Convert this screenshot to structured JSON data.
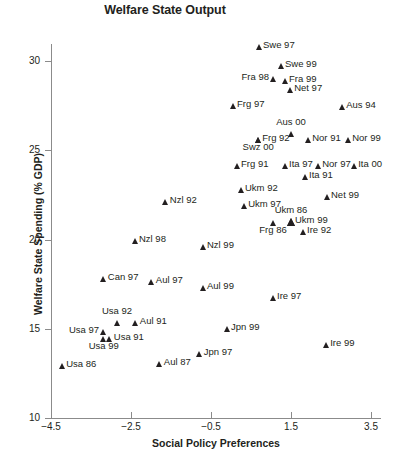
{
  "chart_data": {
    "type": "scatter",
    "title": "Welfare State Output",
    "xlabel": "Social Policy Preferences",
    "ylabel": "Welfare State Spending (% GDP)",
    "xlim": [
      -4.5,
      3.5
    ],
    "ylim": [
      10,
      32
    ],
    "xticks": [
      "-4.5",
      "-2.5",
      "-0.5",
      "1.5",
      "3.5"
    ],
    "xtick_values": [
      -4.5,
      -2.5,
      -0.5,
      1.5,
      3.5
    ],
    "yticks": [
      "10",
      "15",
      "20",
      "25",
      "30"
    ],
    "ytick_values": [
      10,
      15,
      20,
      25,
      30
    ],
    "grid": false,
    "legend": "none",
    "marker": "triangle",
    "marker_color": "#231f20",
    "points": [
      {
        "label": "Swe 97",
        "x": 0.7,
        "y": 30.8,
        "pos": "right"
      },
      {
        "label": "Swe 99",
        "x": 1.25,
        "y": 29.7,
        "pos": "right"
      },
      {
        "label": "Fra 98",
        "x": 1.05,
        "y": 29.0,
        "pos": "left"
      },
      {
        "label": "Fra 99",
        "x": 1.35,
        "y": 28.9,
        "pos": "right"
      },
      {
        "label": "Net 97",
        "x": 1.48,
        "y": 28.4,
        "pos": "right"
      },
      {
        "label": "Frg 97",
        "x": 0.05,
        "y": 27.5,
        "pos": "right"
      },
      {
        "label": "Aus 94",
        "x": 2.78,
        "y": 27.4,
        "pos": "right"
      },
      {
        "label": "Aus 00",
        "x": 1.5,
        "y": 25.9,
        "pos": "above"
      },
      {
        "label": "Frg 92",
        "x": 0.68,
        "y": 25.6,
        "pos": "right"
      },
      {
        "label": "Swz 00",
        "x": 0.68,
        "y": 25.6,
        "pos": "below"
      },
      {
        "label": "Nor 91",
        "x": 1.93,
        "y": 25.6,
        "pos": "right"
      },
      {
        "label": "Nor 99",
        "x": 2.93,
        "y": 25.6,
        "pos": "right"
      },
      {
        "label": "Frg 91",
        "x": 0.15,
        "y": 24.1,
        "pos": "right"
      },
      {
        "label": "Ita 97",
        "x": 1.35,
        "y": 24.1,
        "pos": "right"
      },
      {
        "label": "Nor 97",
        "x": 2.18,
        "y": 24.1,
        "pos": "right"
      },
      {
        "label": "Ita 00",
        "x": 3.08,
        "y": 24.1,
        "pos": "right"
      },
      {
        "label": "Ita 91",
        "x": 1.85,
        "y": 23.5,
        "pos": "right"
      },
      {
        "label": "Ukm 92",
        "x": 0.25,
        "y": 22.8,
        "pos": "right"
      },
      {
        "label": "Net 99",
        "x": 2.4,
        "y": 22.4,
        "pos": "right"
      },
      {
        "label": "Ukm 97",
        "x": 0.33,
        "y": 21.9,
        "pos": "right"
      },
      {
        "label": "Ukm 86",
        "x": 1.5,
        "y": 21.0,
        "pos": "above",
        "big": true
      },
      {
        "label": "Ukm 99",
        "x": 1.5,
        "y": 21.0,
        "pos": "right",
        "big": true
      },
      {
        "label": "Frg 86",
        "x": 1.05,
        "y": 20.9,
        "pos": "below"
      },
      {
        "label": "Ire 92",
        "x": 1.8,
        "y": 20.4,
        "pos": "right"
      },
      {
        "label": "Nzl 92",
        "x": -1.63,
        "y": 22.1,
        "pos": "right"
      },
      {
        "label": "Nzl 98",
        "x": -2.4,
        "y": 19.9,
        "pos": "right"
      },
      {
        "label": "Nzl 99",
        "x": -0.7,
        "y": 19.6,
        "pos": "right"
      },
      {
        "label": "Can 97",
        "x": -3.18,
        "y": 17.8,
        "pos": "right"
      },
      {
        "label": "Aul 97",
        "x": -1.98,
        "y": 17.6,
        "pos": "right"
      },
      {
        "label": "Aul 99",
        "x": -0.7,
        "y": 17.3,
        "pos": "right"
      },
      {
        "label": "Ire 97",
        "x": 1.05,
        "y": 16.7,
        "pos": "right"
      },
      {
        "label": "Usa 92",
        "x": -2.85,
        "y": 15.3,
        "pos": "above"
      },
      {
        "label": "Aul 91",
        "x": -2.38,
        "y": 15.3,
        "pos": "right"
      },
      {
        "label": "Usa 97",
        "x": -3.2,
        "y": 14.8,
        "pos": "left"
      },
      {
        "label": "Usa 91",
        "x": -3.03,
        "y": 14.4,
        "pos": "right"
      },
      {
        "label": "Usa 99",
        "x": -3.18,
        "y": 14.4,
        "pos": "below"
      },
      {
        "label": "Jpn 99",
        "x": -0.1,
        "y": 15.0,
        "pos": "right"
      },
      {
        "label": "Ire 99",
        "x": 2.38,
        "y": 14.1,
        "pos": "right"
      },
      {
        "label": "Jpn 97",
        "x": -0.78,
        "y": 13.6,
        "pos": "right"
      },
      {
        "label": "Aul 87",
        "x": -1.78,
        "y": 13.0,
        "pos": "right"
      },
      {
        "label": "Usa 86",
        "x": -4.22,
        "y": 12.9,
        "pos": "right"
      }
    ]
  }
}
